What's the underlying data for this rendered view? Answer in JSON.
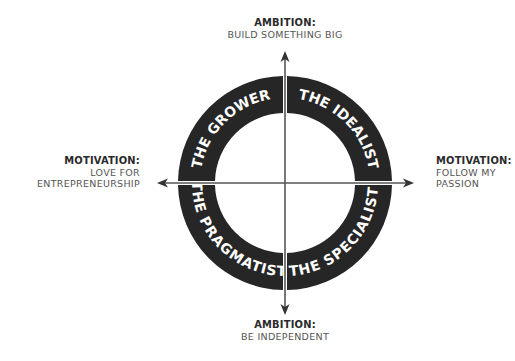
{
  "diagram": {
    "colors": {
      "ring": "#262626",
      "axis": "#555555",
      "ring_text": "#ffffff",
      "label_head": "#2a2a2a",
      "label_sub": "#555555"
    },
    "axes": {
      "top": {
        "heading": "AMBITION:",
        "text": "BUILD SOMETHING BIG"
      },
      "bottom": {
        "heading": "AMBITION:",
        "text": "BE INDEPENDENT"
      },
      "left": {
        "heading": "MOTIVATION:",
        "line1": "LOVE FOR",
        "line2": "ENTREPRENEURSHIP"
      },
      "right": {
        "heading": "MOTIVATION:",
        "line1": "FOLLOW MY",
        "line2": "PASSION"
      }
    },
    "quadrants": [
      {
        "position": "top-left",
        "label": "THE GROWER"
      },
      {
        "position": "top-right",
        "label": "THE IDEALIST"
      },
      {
        "position": "bottom-left",
        "label": "THE PRAGMATIST"
      },
      {
        "position": "bottom-right",
        "label": "THE SPECIALIST"
      }
    ]
  }
}
